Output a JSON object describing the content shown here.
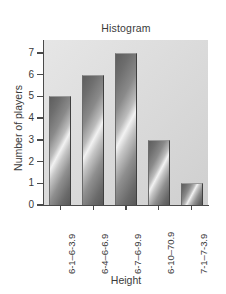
{
  "chart_data": {
    "type": "bar",
    "title": "Histogram",
    "xlabel": "Height",
    "ylabel": "Number of players",
    "categories": [
      "6-1–6-3.9",
      "6-4–6-6.9",
      "6-7–6-9.9",
      "6-10–70.9",
      "7-1–7-3.9"
    ],
    "values": [
      5,
      6,
      7,
      3,
      1
    ],
    "ylim": [
      0,
      7.6
    ],
    "yticks": [
      0,
      1,
      2,
      3,
      4,
      5,
      6,
      7
    ],
    "ytick_labels": [
      "0",
      "1",
      "2",
      "3",
      "4",
      "5",
      "6",
      "7"
    ],
    "grid": false,
    "legend": false,
    "bar_style": "metallic-diagonal-gradient",
    "plot_background": "#dedede",
    "axis_color": "#4a4a4a",
    "text_color": "#3a3a3a"
  }
}
